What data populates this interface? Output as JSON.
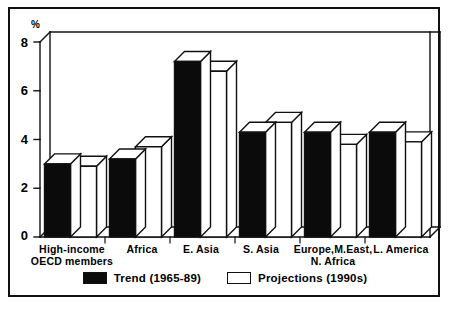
{
  "figure": {
    "axis_unit_label": "%"
  },
  "chart_data": {
    "type": "bar",
    "title": "",
    "subtitle": "",
    "xlabel": "",
    "ylabel": "%",
    "ylim": [
      0,
      8
    ],
    "yticks": [
      0,
      2,
      4,
      6,
      8
    ],
    "ytick_labels": [
      "0",
      "2",
      "4",
      "6",
      "8"
    ],
    "grid": false,
    "legend_position": "bottom-center",
    "style_note": "3D grouped bar chart, black frame",
    "categories": [
      "High-income\nOECD members",
      "Africa",
      "E. Asia",
      "S. Asia",
      "Europe,M.East,\nN. Africa",
      "L. America"
    ],
    "series": [
      {
        "name": "Trend (1965-89)",
        "color": "#0b0b0b",
        "values": [
          3.0,
          3.2,
          7.2,
          4.3,
          4.3,
          4.3
        ]
      },
      {
        "name": "Projections (1990s)",
        "color": "#ffffff",
        "values": [
          2.9,
          3.7,
          6.8,
          4.7,
          3.8,
          3.9
        ]
      }
    ]
  },
  "legend": {
    "items": [
      {
        "label": "Trend (1965-89)",
        "swatch": "filled"
      },
      {
        "label": "Projections (1990s)",
        "swatch": "hollow"
      }
    ]
  }
}
